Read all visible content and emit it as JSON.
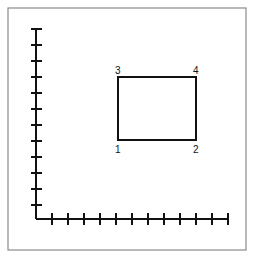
{
  "diagram": {
    "type": "coordinate-rectangle",
    "frame": {
      "x": 8,
      "y": 8,
      "width": 238,
      "height": 242,
      "stroke": "#8a8a8a"
    },
    "axes": {
      "origin": {
        "x": 36,
        "y": 219
      },
      "y_axis": {
        "top": 29,
        "tick_count": 12,
        "tick_spacing": 16
      },
      "x_axis": {
        "right": 229,
        "tick_count": 12,
        "tick_spacing": 16
      },
      "stroke": "#111111"
    },
    "rectangle": {
      "x": 118,
      "y": 77,
      "width": 78,
      "height": 63,
      "stroke": "#111111"
    },
    "corner_labels": [
      {
        "id": "1",
        "text": "1",
        "x": 115,
        "y": 153
      },
      {
        "id": "2",
        "text": "2",
        "x": 193,
        "y": 153
      },
      {
        "id": "3",
        "text": "3",
        "x": 115,
        "y": 74
      },
      {
        "id": "4",
        "text": "4",
        "x": 193,
        "y": 74
      }
    ]
  }
}
